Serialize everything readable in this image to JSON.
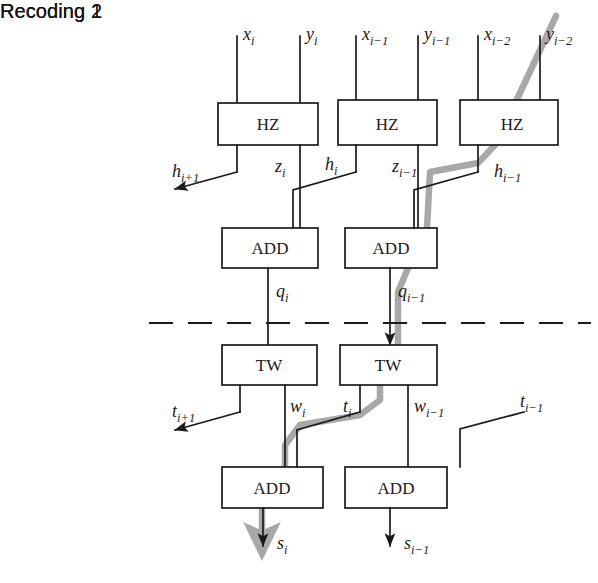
{
  "figure": {
    "type": "block-diagram",
    "background": "#ffffff",
    "line_color": "#1a1a1a",
    "critical_path_color": "#a8a8a8"
  },
  "stages": {
    "recoding1": "Recoding 1",
    "recoding2": "Recoding 2"
  },
  "blocks": {
    "hz": "HZ",
    "add": "ADD",
    "tw": "TW"
  },
  "columns": [
    {
      "index": "i",
      "inputs": {
        "x": "x",
        "x_sub": "i",
        "y": "y",
        "y_sub": "i"
      },
      "hz_out_left": {
        "base": "h",
        "sub": "i+1"
      },
      "hz_out_right": {
        "base": "z",
        "sub": "i"
      },
      "add_out": {
        "base": "q",
        "sub": "i"
      },
      "tw_out_left": {
        "base": "t",
        "sub": "i+1"
      },
      "tw_out_right": {
        "base": "w",
        "sub": "i"
      },
      "sum_out": {
        "base": "s",
        "sub": "i"
      }
    },
    {
      "index": "i-1",
      "inputs": {
        "x": "x",
        "x_sub": "i−1",
        "y": "y",
        "y_sub": "i−1"
      },
      "hz_out_left": {
        "base": "h",
        "sub": "i"
      },
      "hz_out_right": {
        "base": "z",
        "sub": "i−1"
      },
      "add_out": {
        "base": "q",
        "sub": "i−1"
      },
      "tw_out_left": {
        "base": "t",
        "sub": "i"
      },
      "tw_out_right": {
        "base": "w",
        "sub": "i−1"
      },
      "sum_out": {
        "base": "s",
        "sub": "i−1"
      }
    },
    {
      "index": "i-2",
      "inputs": {
        "x": "x",
        "x_sub": "i−2",
        "y": "y",
        "y_sub": "i−2"
      },
      "hz_out_left": {
        "base": "h",
        "sub": "i−1"
      },
      "tw_in_right": {
        "base": "t",
        "sub": "i−1"
      }
    }
  ],
  "signal_labels": {
    "x_i": {
      "base": "x",
      "sub": "i"
    },
    "y_i": {
      "base": "y",
      "sub": "i"
    },
    "x_i1": {
      "base": "x",
      "sub": "i−1"
    },
    "y_i1": {
      "base": "y",
      "sub": "i−1"
    },
    "x_i2": {
      "base": "x",
      "sub": "i−2"
    },
    "y_i2": {
      "base": "y",
      "sub": "i−2"
    },
    "h_ip1": {
      "base": "h",
      "sub": "i+1"
    },
    "z_i": {
      "base": "z",
      "sub": "i"
    },
    "h_i": {
      "base": "h",
      "sub": "i"
    },
    "z_i1": {
      "base": "z",
      "sub": "i−1"
    },
    "h_i1": {
      "base": "h",
      "sub": "i−1"
    },
    "q_i": {
      "base": "q",
      "sub": "i"
    },
    "q_i1": {
      "base": "q",
      "sub": "i−1"
    },
    "t_ip1": {
      "base": "t",
      "sub": "i+1"
    },
    "w_i": {
      "base": "w",
      "sub": "i"
    },
    "t_i": {
      "base": "t",
      "sub": "i"
    },
    "w_i1": {
      "base": "w",
      "sub": "i−1"
    },
    "t_i1": {
      "base": "t",
      "sub": "i−1"
    },
    "s_i": {
      "base": "s",
      "sub": "i"
    },
    "s_i1": {
      "base": "s",
      "sub": "i−1"
    }
  },
  "separator": {
    "style": "dashed",
    "y": 323
  }
}
